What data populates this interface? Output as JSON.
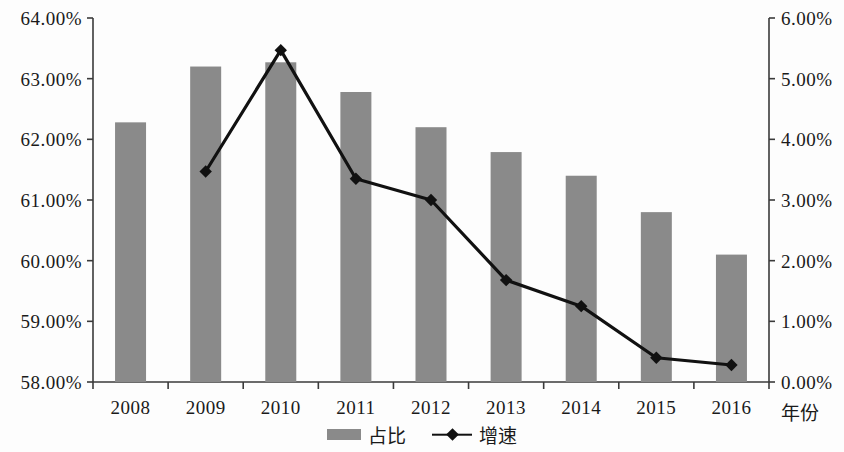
{
  "chart_data": {
    "type": "bar",
    "title": "",
    "subtitle": "",
    "xlabel": "年份",
    "ylabel": "",
    "categories": [
      "2008",
      "2009",
      "2010",
      "2011",
      "2012",
      "2013",
      "2014",
      "2015",
      "2016"
    ],
    "axes": {
      "left": {
        "label": "",
        "ylim": [
          58.0,
          64.0
        ],
        "tick_step": 1.0,
        "ticks": [
          "58.00%",
          "59.00%",
          "60.00%",
          "61.00%",
          "62.00%",
          "63.00%",
          "64.00%"
        ],
        "tick_values": [
          58.0,
          59.0,
          60.0,
          61.0,
          62.0,
          63.0,
          64.0
        ]
      },
      "right": {
        "label": "",
        "ylim": [
          0.0,
          6.0
        ],
        "tick_step": 1.0,
        "ticks": [
          "0.00%",
          "1.00%",
          "2.00%",
          "3.00%",
          "4.00%",
          "5.00%",
          "6.00%"
        ],
        "tick_values": [
          0.0,
          1.0,
          2.0,
          3.0,
          4.0,
          5.0,
          6.0
        ]
      }
    },
    "grid": false,
    "legend_position": "bottom",
    "series": [
      {
        "name": "占比",
        "type": "bar",
        "axis": "left",
        "color": "#8a8a8a",
        "values": [
          62.28,
          63.2,
          63.27,
          62.78,
          62.2,
          61.79,
          61.4,
          60.8,
          60.1
        ]
      },
      {
        "name": "增速",
        "type": "line",
        "axis": "right",
        "color": "#111111",
        "marker": "diamond",
        "values": [
          null,
          3.47,
          5.47,
          3.35,
          3.0,
          1.68,
          1.25,
          0.4,
          0.28
        ]
      }
    ]
  },
  "legend": {
    "items": [
      {
        "label": "占比",
        "marker": "bar-swatch",
        "color": "#8a8a8a"
      },
      {
        "label": "增速",
        "marker": "line-diamond",
        "color": "#111111"
      }
    ]
  }
}
